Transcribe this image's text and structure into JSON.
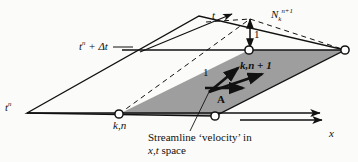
{
  "figure": {
    "background_color": "#fbfbf9",
    "shaded_face_color": "#9e9e9e",
    "line_color": "#111111"
  },
  "axes": {
    "t_axis_label": "t",
    "x_axis_label": "x"
  },
  "labels": {
    "time_level_upper": {
      "base": "t",
      "superscript": "n",
      "suffix": " + Δt"
    },
    "time_level_lower": {
      "base": "t",
      "superscript": "n"
    },
    "nodal_value": {
      "base": "N",
      "subscript": "k",
      "superscript": "n+1"
    },
    "unit_vertical": "1",
    "unit_slant": "1",
    "node_upper": "k,n + 1",
    "node_lower": "k,n",
    "vector_a": "A",
    "caption_line1": "Streamline ‘velocity’ in",
    "caption_line2_plain": "space",
    "caption_line2_italic": "x,t"
  },
  "geometry": {
    "plane_vertices": [
      [
        27,
        113
      ],
      [
        199,
        16
      ],
      [
        345,
        50
      ],
      [
        215,
        116
      ]
    ],
    "shaded_face_vertices": [
      [
        119,
        114
      ],
      [
        249,
        50
      ],
      [
        345,
        50
      ],
      [
        215,
        116
      ]
    ],
    "nodes": [
      [
        119,
        114
      ],
      [
        249,
        50
      ],
      [
        345,
        50
      ],
      [
        215,
        116
      ]
    ],
    "apex": [
      250,
      17
    ],
    "unit_arrow": {
      "from": [
        250,
        17
      ],
      "to": [
        250,
        49
      ]
    }
  }
}
